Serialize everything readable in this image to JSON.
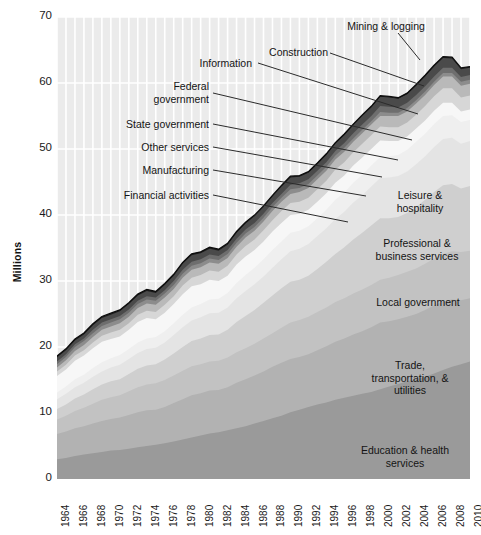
{
  "chart_data": {
    "type": "area",
    "title": "",
    "subtitle": "",
    "xlabel": "",
    "ylabel": "Millions",
    "ylim": [
      0,
      70
    ],
    "xlim": [
      1964,
      2010
    ],
    "yticks": [
      0,
      10,
      20,
      30,
      40,
      50,
      60,
      70
    ],
    "ytick_labels": [
      "0",
      "10",
      "20",
      "30",
      "40",
      "50",
      "60",
      "70"
    ],
    "grid": true,
    "legend_position": "inline-annotations",
    "stacked": true,
    "units": "Millions of employees",
    "x": [
      1964,
      1965,
      1966,
      1967,
      1968,
      1969,
      1970,
      1971,
      1972,
      1973,
      1974,
      1975,
      1976,
      1977,
      1978,
      1979,
      1980,
      1981,
      1982,
      1983,
      1984,
      1985,
      1986,
      1987,
      1988,
      1989,
      1990,
      1991,
      1992,
      1993,
      1994,
      1995,
      1996,
      1997,
      1998,
      1999,
      2000,
      2001,
      2002,
      2003,
      2004,
      2005,
      2006,
      2007,
      2008,
      2009,
      2010
    ],
    "xtick_labels": [
      "1964",
      "1966",
      "1968",
      "1970",
      "1972",
      "1974",
      "1976",
      "1978",
      "1980",
      "1982",
      "1984",
      "1986",
      "1988",
      "1990",
      "1992",
      "1994",
      "1996",
      "1998",
      "2000",
      "2002",
      "2004",
      "2006",
      "2008",
      "2010"
    ],
    "xticks": [
      1964,
      1966,
      1968,
      1970,
      1972,
      1974,
      1976,
      1978,
      1980,
      1982,
      1984,
      1986,
      1988,
      1990,
      1992,
      1994,
      1996,
      1998,
      2000,
      2002,
      2004,
      2006,
      2008,
      2010
    ],
    "totals": [
      18.0,
      18.8,
      19.9,
      20.7,
      21.5,
      22.4,
      22.8,
      22.9,
      23.8,
      25.0,
      25.6,
      25.2,
      26.2,
      27.5,
      29.3,
      30.7,
      31.2,
      31.5,
      31.3,
      31.9,
      33.7,
      35.0,
      36.1,
      37.4,
      38.8,
      40.1,
      40.7,
      40.3,
      40.5,
      41.7,
      43.5,
      45.2,
      46.8,
      48.5,
      50.1,
      51.6,
      53.2,
      52.8,
      52.3,
      52.6,
      53.6,
      55.0,
      56.6,
      57.9,
      57.5,
      55.3,
      55.0
    ],
    "series": [
      {
        "name": "Education & health services",
        "fill": "#9a9a9a",
        "label_position": "inside",
        "values": [
          3.0,
          3.2,
          3.5,
          3.7,
          3.9,
          4.1,
          4.3,
          4.4,
          4.6,
          4.8,
          5.0,
          5.2,
          5.4,
          5.7,
          6.0,
          6.3,
          6.6,
          6.9,
          7.1,
          7.4,
          7.7,
          8.0,
          8.4,
          8.8,
          9.2,
          9.6,
          10.1,
          10.5,
          10.9,
          11.3,
          11.6,
          12.0,
          12.3,
          12.6,
          12.9,
          13.2,
          13.6,
          14.0,
          14.4,
          14.8,
          15.1,
          15.5,
          16.0,
          16.5,
          17.0,
          17.4,
          17.8
        ]
      },
      {
        "name": "Trade, transportation, & utilities",
        "fill": "#b2b2b2",
        "label_position": "inside",
        "values": [
          3.8,
          4.0,
          4.2,
          4.3,
          4.5,
          4.7,
          4.8,
          4.9,
          5.1,
          5.3,
          5.4,
          5.3,
          5.5,
          5.8,
          6.1,
          6.4,
          6.4,
          6.5,
          6.4,
          6.5,
          6.9,
          7.1,
          7.3,
          7.5,
          7.8,
          8.0,
          8.1,
          8.0,
          8.0,
          8.2,
          8.5,
          8.8,
          9.0,
          9.3,
          9.5,
          9.8,
          10.1,
          9.9,
          9.8,
          9.8,
          9.9,
          10.1,
          10.3,
          10.4,
          10.2,
          9.7,
          9.6
        ]
      },
      {
        "name": "Local government",
        "fill": "#c2c2c2",
        "label_position": "inside",
        "values": [
          2.2,
          2.4,
          2.6,
          2.8,
          3.0,
          3.2,
          3.3,
          3.4,
          3.6,
          3.8,
          3.9,
          4.0,
          4.1,
          4.2,
          4.3,
          4.4,
          4.4,
          4.4,
          4.4,
          4.5,
          4.6,
          4.7,
          4.8,
          5.0,
          5.1,
          5.3,
          5.5,
          5.6,
          5.7,
          5.8,
          5.9,
          6.0,
          6.1,
          6.2,
          6.3,
          6.4,
          6.5,
          6.6,
          6.7,
          6.8,
          6.9,
          7.0,
          7.1,
          7.2,
          7.3,
          7.3,
          7.2
        ]
      },
      {
        "name": "Professional & business services",
        "fill": "#cfcfcf",
        "label_position": "inside",
        "values": [
          1.6,
          1.7,
          1.9,
          2.0,
          2.2,
          2.3,
          2.4,
          2.4,
          2.6,
          2.8,
          2.9,
          2.9,
          3.1,
          3.3,
          3.6,
          3.8,
          3.9,
          4.0,
          4.0,
          4.2,
          4.6,
          4.9,
          5.1,
          5.4,
          5.7,
          6.0,
          6.2,
          6.1,
          6.2,
          6.5,
          6.9,
          7.3,
          7.7,
          8.2,
          8.6,
          9.0,
          9.3,
          9.0,
          8.8,
          8.9,
          9.3,
          9.7,
          10.1,
          10.4,
          10.2,
          9.6,
          9.8
        ]
      },
      {
        "name": "Leisure & hospitality",
        "fill": "#e4e4e4",
        "label_position": "inside",
        "values": [
          1.5,
          1.6,
          1.7,
          1.8,
          1.9,
          2.0,
          2.1,
          2.2,
          2.3,
          2.4,
          2.5,
          2.5,
          2.6,
          2.8,
          3.0,
          3.1,
          3.2,
          3.3,
          3.3,
          3.4,
          3.6,
          3.8,
          3.9,
          4.0,
          4.2,
          4.4,
          4.6,
          4.7,
          4.8,
          5.0,
          5.1,
          5.3,
          5.4,
          5.6,
          5.7,
          5.9,
          6.1,
          6.2,
          6.2,
          6.3,
          6.5,
          6.6,
          6.8,
          7.0,
          7.0,
          6.8,
          6.8
        ]
      },
      {
        "name": "Financial activities",
        "fill": "#efefef",
        "label_position": "callout",
        "values": [
          1.0,
          1.1,
          1.2,
          1.2,
          1.3,
          1.4,
          1.4,
          1.5,
          1.5,
          1.6,
          1.6,
          1.6,
          1.7,
          1.8,
          1.9,
          2.0,
          2.0,
          2.1,
          2.1,
          2.2,
          2.3,
          2.4,
          2.5,
          2.6,
          2.7,
          2.7,
          2.8,
          2.7,
          2.7,
          2.7,
          2.8,
          2.9,
          2.9,
          3.0,
          3.1,
          3.2,
          3.2,
          3.2,
          3.2,
          3.3,
          3.4,
          3.4,
          3.5,
          3.5,
          3.4,
          3.3,
          3.2
        ]
      },
      {
        "name": "Manufacturing",
        "fill": "#f7f7f7",
        "label_position": "callout",
        "values": [
          2.5,
          2.6,
          2.8,
          2.9,
          3.0,
          3.1,
          2.9,
          2.8,
          2.9,
          3.1,
          3.1,
          2.7,
          2.8,
          2.9,
          3.1,
          3.2,
          3.0,
          3.0,
          2.7,
          2.6,
          2.8,
          2.8,
          2.7,
          2.7,
          2.8,
          2.8,
          2.7,
          2.6,
          2.5,
          2.5,
          2.5,
          2.6,
          2.6,
          2.6,
          2.6,
          2.5,
          2.5,
          2.3,
          2.1,
          2.0,
          2.0,
          2.0,
          2.0,
          2.0,
          1.9,
          1.6,
          1.6
        ]
      },
      {
        "name": "Other services",
        "fill": "#d7d7d7",
        "label_position": "callout",
        "values": [
          0.7,
          0.7,
          0.8,
          0.8,
          0.9,
          0.9,
          1.0,
          1.0,
          1.0,
          1.1,
          1.1,
          1.1,
          1.2,
          1.2,
          1.3,
          1.3,
          1.4,
          1.4,
          1.4,
          1.5,
          1.5,
          1.6,
          1.6,
          1.7,
          1.7,
          1.8,
          1.8,
          1.8,
          1.8,
          1.9,
          1.9,
          2.0,
          2.0,
          2.0,
          2.1,
          2.1,
          2.1,
          2.1,
          2.1,
          2.1,
          2.1,
          2.2,
          2.2,
          2.2,
          2.2,
          2.1,
          2.1
        ]
      },
      {
        "name": "State government",
        "fill": "#b9b9b9",
        "label_position": "callout",
        "values": [
          0.6,
          0.7,
          0.7,
          0.8,
          0.8,
          0.9,
          0.9,
          1.0,
          1.0,
          1.0,
          1.1,
          1.1,
          1.1,
          1.1,
          1.2,
          1.2,
          1.2,
          1.2,
          1.2,
          1.2,
          1.2,
          1.3,
          1.3,
          1.3,
          1.4,
          1.4,
          1.4,
          1.5,
          1.5,
          1.5,
          1.5,
          1.5,
          1.6,
          1.6,
          1.6,
          1.6,
          1.6,
          1.7,
          1.7,
          1.7,
          1.7,
          1.7,
          1.7,
          1.8,
          1.8,
          1.8,
          1.8
        ]
      },
      {
        "name": "Federal government",
        "fill": "#8c8c8c",
        "label_position": "callout",
        "values": [
          0.5,
          0.5,
          0.6,
          0.6,
          0.6,
          0.6,
          0.6,
          0.6,
          0.6,
          0.6,
          0.6,
          0.6,
          0.6,
          0.6,
          0.6,
          0.6,
          0.6,
          0.6,
          0.6,
          0.6,
          0.6,
          0.6,
          0.6,
          0.6,
          0.6,
          0.6,
          0.7,
          0.6,
          0.6,
          0.6,
          0.6,
          0.6,
          0.6,
          0.5,
          0.5,
          0.5,
          0.6,
          0.5,
          0.5,
          0.5,
          0.5,
          0.5,
          0.5,
          0.5,
          0.5,
          0.6,
          0.6
        ]
      },
      {
        "name": "Information",
        "fill": "#6e6e6e",
        "label_position": "callout",
        "values": [
          0.4,
          0.4,
          0.4,
          0.4,
          0.5,
          0.5,
          0.5,
          0.5,
          0.5,
          0.5,
          0.5,
          0.5,
          0.5,
          0.6,
          0.6,
          0.6,
          0.6,
          0.6,
          0.6,
          0.6,
          0.6,
          0.6,
          0.6,
          0.6,
          0.6,
          0.6,
          0.7,
          0.7,
          0.7,
          0.7,
          0.7,
          0.7,
          0.7,
          0.8,
          0.8,
          0.8,
          0.9,
          0.9,
          0.8,
          0.8,
          0.8,
          0.8,
          0.8,
          0.8,
          0.8,
          0.7,
          0.7
        ]
      },
      {
        "name": "Construction",
        "fill": "#4a4a4a",
        "label_position": "callout",
        "values": [
          0.6,
          0.6,
          0.6,
          0.6,
          0.7,
          0.7,
          0.7,
          0.7,
          0.8,
          0.8,
          0.8,
          0.7,
          0.8,
          0.8,
          0.9,
          1.0,
          0.9,
          0.9,
          0.8,
          0.8,
          0.9,
          0.9,
          1.0,
          1.0,
          1.0,
          1.1,
          1.1,
          1.0,
          1.0,
          1.0,
          1.1,
          1.1,
          1.2,
          1.2,
          1.3,
          1.3,
          1.4,
          1.4,
          1.3,
          1.3,
          1.4,
          1.5,
          1.5,
          1.5,
          1.4,
          1.2,
          1.1
        ]
      },
      {
        "name": "Mining & logging",
        "fill": "#1f1f1f",
        "label_position": "callout",
        "values": [
          0.22,
          0.22,
          0.22,
          0.22,
          0.22,
          0.22,
          0.22,
          0.22,
          0.22,
          0.22,
          0.22,
          0.22,
          0.22,
          0.22,
          0.23,
          0.23,
          0.22,
          0.22,
          0.22,
          0.2,
          0.2,
          0.2,
          0.18,
          0.18,
          0.18,
          0.18,
          0.18,
          0.18,
          0.17,
          0.17,
          0.17,
          0.17,
          0.17,
          0.17,
          0.17,
          0.17,
          0.17,
          0.17,
          0.17,
          0.17,
          0.17,
          0.18,
          0.19,
          0.2,
          0.21,
          0.19,
          0.19
        ]
      }
    ],
    "annotations": [
      {
        "text": "Mining & logging",
        "anchor": "top-band"
      },
      {
        "text": "Construction",
        "anchor": "construction-band"
      },
      {
        "text": "Information",
        "anchor": "information-band"
      },
      {
        "text": "Federal\ngovernment",
        "anchor": "federal-band"
      },
      {
        "text": "State government",
        "anchor": "state-band"
      },
      {
        "text": "Other services",
        "anchor": "other-services-band"
      },
      {
        "text": "Manufacturing",
        "anchor": "manufacturing-band"
      },
      {
        "text": "Financial activities",
        "anchor": "financial-band"
      },
      {
        "text": "Leisure &\nhospitality",
        "anchor": "leisure-band"
      },
      {
        "text": "Professional &\nbusiness services",
        "anchor": "professional-band"
      },
      {
        "text": "Local government",
        "anchor": "local-government-band"
      },
      {
        "text": "Trade,\ntransportation, &\nutilities",
        "anchor": "trade-band"
      },
      {
        "text": "Education & health\nservices",
        "anchor": "education-band"
      }
    ]
  },
  "labels": {
    "y_axis_title": "Millions",
    "mining_logging": "Mining & logging",
    "construction": "Construction",
    "information": "Information",
    "federal_government": "Federal\ngovernment",
    "state_government": "State government",
    "other_services": "Other services",
    "manufacturing": "Manufacturing",
    "financial_activities": "Financial activities",
    "leisure_hospitality": "Leisure &\nhospitality",
    "professional_business": "Professional &\nbusiness services",
    "local_government": "Local government",
    "trade_transport_utilities": "Trade,\ntransportation, &\nutilities",
    "education_health": "Education & health\nservices"
  },
  "colors": {
    "plot_background": "#ebebeb",
    "gridline": "#ffffff",
    "text": "#141414",
    "leader_line": "#2b2b2b"
  }
}
